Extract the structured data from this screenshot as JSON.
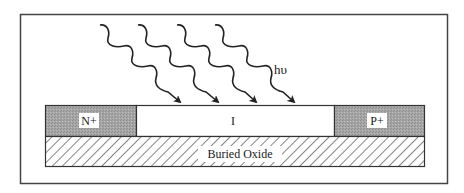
{
  "diagram": {
    "photon_label": "hυ",
    "photon_count": 4,
    "regions": [
      {
        "id": "n-plus",
        "label": "N+",
        "fill": "#a8a8a8"
      },
      {
        "id": "intrinsic",
        "label": "I",
        "fill": "#ffffff"
      },
      {
        "id": "p-plus",
        "label": "P+",
        "fill": "#a8a8a8"
      }
    ],
    "substrate": {
      "label": "Buried Oxide",
      "pattern": "diagonal-hatch"
    },
    "colors": {
      "stroke": "#333333",
      "doped_fill": "#a8a8a8",
      "background": "#ffffff"
    }
  }
}
